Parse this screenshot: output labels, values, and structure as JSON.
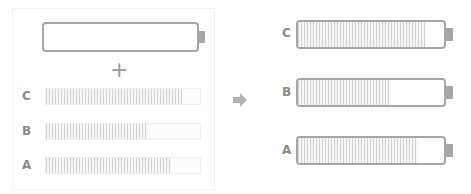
{
  "left_panel": {
    "empty_battery": {
      "fill_percent": 0
    },
    "operator": "+",
    "bars": [
      {
        "label": "C",
        "fill_percent": 89
      },
      {
        "label": "B",
        "fill_percent": 66
      },
      {
        "label": "A",
        "fill_percent": 81
      }
    ]
  },
  "arrow": {
    "icon": "right-arrow-icon"
  },
  "right_panel": {
    "batteries": [
      {
        "label": "C",
        "fill_percent": 88
      },
      {
        "label": "B",
        "fill_percent": 64
      },
      {
        "label": "A",
        "fill_percent": 82
      }
    ]
  },
  "colors": {
    "outline": "#a6a6a6",
    "hatch_line": "#d2d2d2",
    "label": "#8a8a8a",
    "arrow": "#b3b3b3"
  }
}
